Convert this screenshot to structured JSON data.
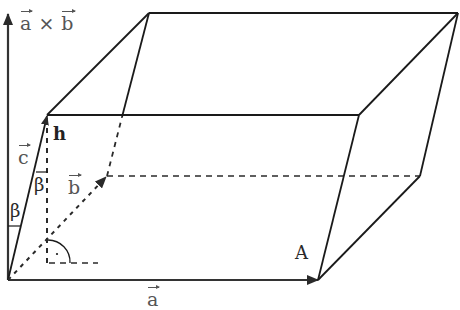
{
  "diagram": {
    "labels": {
      "cross_a": "a",
      "cross_times": "×",
      "cross_b": "b",
      "vec_a": "a",
      "vec_b": "b",
      "vec_c": "c",
      "height": "h",
      "beta_outer": "β",
      "beta_inner": "β",
      "point_A": "A"
    },
    "colors": {
      "stroke": "#1a1a1a",
      "dashed": "#2a2a2a",
      "label": "#2a2a2a",
      "axis": "#333333"
    },
    "vertices": {
      "O": [
        8,
        280
      ],
      "A": [
        318,
        280
      ],
      "B": [
        107,
        176
      ],
      "AB": [
        420,
        176
      ],
      "C": [
        47,
        115
      ],
      "AC": [
        359,
        115
      ],
      "BC": [
        149,
        13
      ],
      "ABC": [
        458,
        13
      ]
    }
  }
}
